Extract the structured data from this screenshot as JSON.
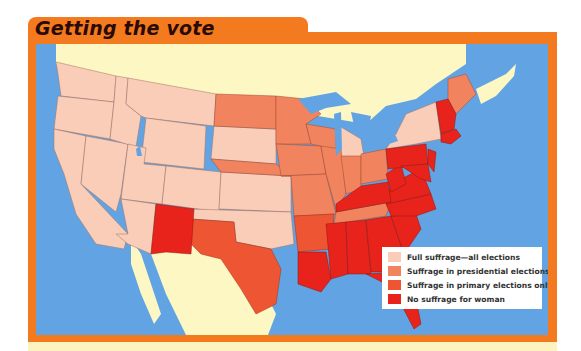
{
  "title": "Getting the vote",
  "colors": {
    "frame": "#f47a20",
    "water": "#62a4e3",
    "foreign_land": "#fdf7c3",
    "full_suffrage": "#f9cdb8",
    "presidential_only": "#f1845f",
    "primary_only": "#ee5633",
    "no_suffrage": "#e8231c"
  },
  "legend": {
    "items": [
      {
        "label": "Full suffrage—all elections",
        "color": "#f9cdb8"
      },
      {
        "label": "Suffrage in presidential elections only",
        "color": "#f1845f"
      },
      {
        "label": "Suffrage in primary elections only",
        "color": "#ee5633"
      },
      {
        "label": "No suffrage for woman",
        "color": "#e8231c"
      }
    ]
  },
  "map_data": {
    "full_suffrage": [
      "Washington",
      "Oregon",
      "California",
      "Nevada",
      "Idaho",
      "Montana",
      "Wyoming",
      "Utah",
      "Colorado",
      "Arizona",
      "Kansas",
      "Oklahoma",
      "South Dakota",
      "Michigan",
      "New York"
    ],
    "presidential_only": [
      "North Dakota",
      "Nebraska",
      "Minnesota",
      "Iowa",
      "Missouri",
      "Wisconsin",
      "Illinois",
      "Indiana",
      "Ohio",
      "Maine",
      "Tennessee",
      "Rhode Island"
    ],
    "primary_only": [
      "Texas",
      "Arkansas"
    ],
    "no_suffrage": [
      "New Mexico",
      "Louisiana",
      "Mississippi",
      "Alabama",
      "Georgia",
      "Florida",
      "South Carolina",
      "North Carolina",
      "Virginia",
      "West Virginia",
      "Kentucky",
      "Pennsylvania",
      "Maryland",
      "Delaware",
      "New Jersey",
      "Vermont",
      "New Hampshire",
      "Massachusetts",
      "Connecticut"
    ]
  }
}
